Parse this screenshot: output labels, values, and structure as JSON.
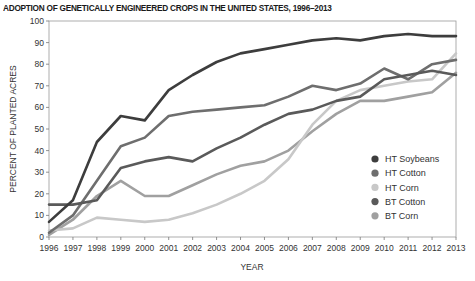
{
  "chart_data": {
    "type": "line",
    "title": "ADOPTION OF GENETICALLY ENGINEERED CROPS IN THE UNITED STATES, 1996–2013",
    "xlabel": "YEAR",
    "ylabel": "PERCENT OF PLANTED ACRES",
    "ylim": [
      0,
      100
    ],
    "yticks": [
      0,
      10,
      20,
      30,
      40,
      50,
      60,
      70,
      80,
      90,
      100
    ],
    "x": [
      1996,
      1997,
      1998,
      1999,
      2000,
      2001,
      2002,
      2003,
      2004,
      2005,
      2006,
      2007,
      2008,
      2009,
      2010,
      2011,
      2012,
      2013
    ],
    "grid": false,
    "legend_position": "lower right inside",
    "series": [
      {
        "name": "HT Soybeans",
        "color": "#3d3d3d",
        "values": [
          7,
          17,
          44,
          56,
          54,
          68,
          75,
          81,
          85,
          87,
          89,
          91,
          92,
          91,
          93,
          94,
          93,
          93
        ]
      },
      {
        "name": "HT Cotton",
        "color": "#6e6e6e",
        "values": [
          2,
          10,
          26,
          42,
          46,
          56,
          58,
          59,
          60,
          61,
          65,
          70,
          68,
          71,
          78,
          73,
          80,
          82
        ]
      },
      {
        "name": "HT Corn",
        "color": "#c8c8c8",
        "values": [
          3,
          4,
          9,
          8,
          7,
          8,
          11,
          15,
          20,
          26,
          36,
          52,
          63,
          68,
          70,
          72,
          73,
          85
        ]
      },
      {
        "name": "BT Cotton",
        "color": "#5a5a5a",
        "values": [
          15,
          15,
          17,
          32,
          35,
          37,
          35,
          41,
          46,
          52,
          57,
          59,
          63,
          65,
          73,
          75,
          77,
          75
        ]
      },
      {
        "name": "BT Corn",
        "color": "#a0a0a0",
        "values": [
          1,
          8,
          19,
          26,
          19,
          19,
          24,
          29,
          33,
          35,
          40,
          49,
          57,
          63,
          63,
          65,
          67,
          76
        ]
      }
    ]
  }
}
